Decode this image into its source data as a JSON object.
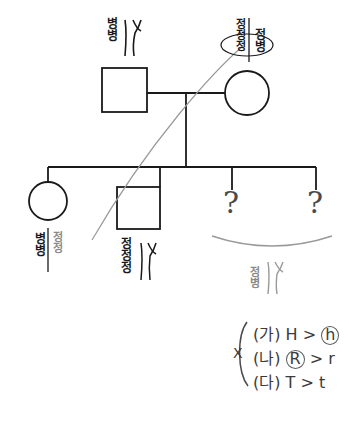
{
  "diagram": {
    "colors": {
      "line_dark": "#1a1a1a",
      "line_gray": "#9a9a9a",
      "text_dark": "#1a1a1a",
      "text_gray": "#8a8a8a",
      "ink": "#3b3b3b",
      "background": "#ffffff"
    }
  },
  "generation1": {
    "father": {
      "symbol": "square",
      "label_dark": "병병",
      "chromosome_icon": "xy-chromosome-icon"
    },
    "mother": {
      "symbol": "circle",
      "label_circled": "정정정",
      "label_right": "정병"
    }
  },
  "generation2": {
    "children": [
      {
        "symbol": "circle",
        "label_dark": "병병",
        "label_gray": "정정"
      },
      {
        "symbol": "square",
        "label_dark": "정정정",
        "chromosome_icon": "xy-chromosome-icon"
      },
      {
        "symbol": "question",
        "label": "?"
      },
      {
        "symbol": "question",
        "label": "?"
      }
    ],
    "bracket_label_gray": "정병",
    "bracket_chromosome_icon": "xy-chromosome-icon"
  },
  "cross_notes": {
    "cross_symbol": "X",
    "lines": [
      {
        "tag": "(가)",
        "dominant": "H",
        "relation": ">",
        "recessive": "h",
        "circled": "recessive"
      },
      {
        "tag": "(나)",
        "dominant": "R",
        "relation": ">",
        "recessive": "r",
        "circled": "dominant"
      },
      {
        "tag": "(다)",
        "dominant": "T",
        "relation": ">",
        "recessive": "t",
        "circled": "none"
      }
    ]
  }
}
